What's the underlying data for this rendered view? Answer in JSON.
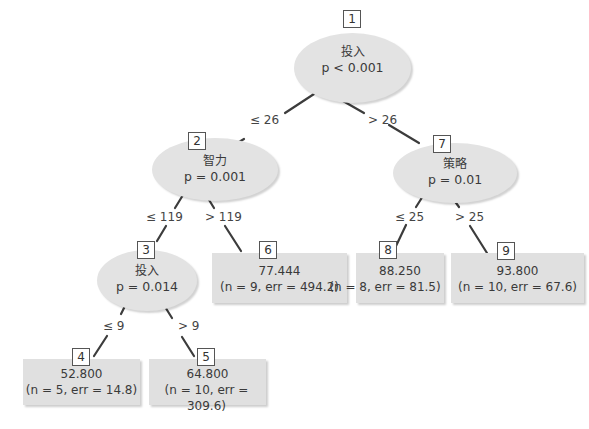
{
  "tree": {
    "inner_nodes": [
      {
        "id": "1",
        "variable": "投入",
        "p_value": "p < 0.001"
      },
      {
        "id": "2",
        "variable": "智力",
        "p_value": "p = 0.001"
      },
      {
        "id": "3",
        "variable": "投入",
        "p_value": "p = 0.014"
      },
      {
        "id": "7",
        "variable": "策略",
        "p_value": "p = 0.01"
      }
    ],
    "leaf_nodes": [
      {
        "id": "4",
        "mean": "52.800",
        "stats": "(n = 5, err = 14.8)"
      },
      {
        "id": "5",
        "mean": "64.800",
        "stats": "(n = 10, err = 309.6)"
      },
      {
        "id": "6",
        "mean": "77.444",
        "stats": "(n = 9, err = 494.2)"
      },
      {
        "id": "8",
        "mean": "88.250",
        "stats": "(n = 8, err = 81.5)"
      },
      {
        "id": "9",
        "mean": "93.800",
        "stats": "(n = 10, err = 67.6)"
      }
    ],
    "edges": [
      {
        "from": "1",
        "to": "2",
        "label": "≤ 26"
      },
      {
        "from": "1",
        "to": "7",
        "label": "> 26"
      },
      {
        "from": "2",
        "to": "3",
        "label": "≤ 119"
      },
      {
        "from": "2",
        "to": "6",
        "label": "> 119"
      },
      {
        "from": "3",
        "to": "4",
        "label": "≤ 9"
      },
      {
        "from": "3",
        "to": "5",
        "label": "> 9"
      },
      {
        "from": "7",
        "to": "8",
        "label": "≤ 25"
      },
      {
        "from": "7",
        "to": "9",
        "label": "> 25"
      }
    ]
  }
}
